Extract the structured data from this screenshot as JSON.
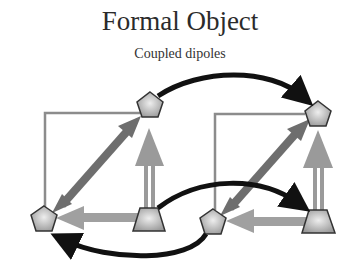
{
  "title": "Formal Object",
  "subtitle": "Coupled dipoles",
  "diagram": {
    "blocks": [
      {
        "name": "left-dipole-pair",
        "nodes": [
          {
            "id": "L-top-pentagon",
            "shape": "pentagon"
          },
          {
            "id": "L-bottom-pentagon",
            "shape": "pentagon"
          },
          {
            "id": "L-trapezoid",
            "shape": "trapezoid"
          }
        ]
      },
      {
        "name": "right-dipole-pair",
        "nodes": [
          {
            "id": "R-top-pentagon",
            "shape": "pentagon"
          },
          {
            "id": "R-bottom-pentagon",
            "shape": "pentagon"
          },
          {
            "id": "R-trapezoid",
            "shape": "trapezoid"
          }
        ]
      }
    ],
    "couplings": [
      {
        "from": "L-top-pentagon",
        "to": "R-top-pentagon"
      },
      {
        "from": "L-trapezoid",
        "to": "R-trapezoid"
      },
      {
        "from": "R-bottom-pentagon",
        "to": "L-bottom-pentagon"
      }
    ],
    "colors": {
      "node_fill": "#b8b8b8",
      "node_stroke": "#333333",
      "diagonal_arrow": "#6e6e6e",
      "light_arrow": "#9a9a9a",
      "frame": "#8c8c8c",
      "coupling_arrow": "#111111"
    }
  }
}
